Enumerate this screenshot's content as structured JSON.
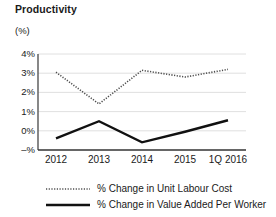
{
  "chart_data": {
    "type": "line",
    "title": "Productivity",
    "ylabel": "(%)",
    "xlabel": "",
    "categories": [
      "2012",
      "2013",
      "2014",
      "2015",
      "1Q 2016"
    ],
    "ytick_labels": [
      "4%",
      "3%",
      "2%",
      "1%",
      "0%",
      "–%"
    ],
    "ytick_values": [
      4,
      3,
      2,
      1,
      0,
      -1
    ],
    "ylim": [
      -1,
      4
    ],
    "grid": true,
    "legend_position": "bottom",
    "series": [
      {
        "name": "% Change in Unit Labour Cost",
        "style": "dotted",
        "color": "#4d4d4d",
        "values": [
          3.05,
          1.4,
          3.15,
          2.8,
          3.2
        ]
      },
      {
        "name": "% Change in Value Added Per Worker",
        "style": "solid",
        "color": "#111111",
        "values": [
          -0.4,
          0.5,
          -0.6,
          -0.05,
          0.55
        ]
      }
    ]
  },
  "legend": {
    "items": [
      {
        "label": "% Change in Unit Labour Cost",
        "marker": "dotted-line-icon"
      },
      {
        "label": "% Change in Value Added Per Worker",
        "marker": "solid-line-icon"
      }
    ]
  }
}
